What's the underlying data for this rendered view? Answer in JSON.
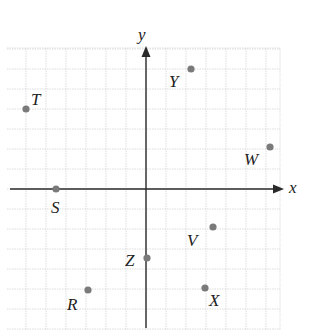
{
  "diagram": {
    "type": "coordinate-plane",
    "axes": {
      "x_label": "x",
      "y_label": "y"
    },
    "grid": {
      "x_min": -7,
      "x_max": 6.7,
      "y_min": -7,
      "y_max": 7,
      "cell_px": 20
    },
    "points": [
      {
        "name": "T",
        "x": -6,
        "y": 4,
        "label_dx": 5,
        "label_dy": -4
      },
      {
        "name": "Y",
        "x": 2.25,
        "y": 6,
        "label_dx": -22,
        "label_dy": 18
      },
      {
        "name": "W",
        "x": 6.2,
        "y": 2.1,
        "label_dx": -26,
        "label_dy": 18
      },
      {
        "name": "S",
        "x": -4.5,
        "y": 0,
        "label_dx": -5,
        "label_dy": 24
      },
      {
        "name": "V",
        "x": 3.35,
        "y": -1.9,
        "label_dx": -26,
        "label_dy": 19
      },
      {
        "name": "Z",
        "x": 0.05,
        "y": -3.45,
        "label_dx": -22,
        "label_dy": 8
      },
      {
        "name": "R",
        "x": -2.9,
        "y": -5.05,
        "label_dx": -21,
        "label_dy": 20
      },
      {
        "name": "X",
        "x": 2.95,
        "y": -4.95,
        "label_dx": 4,
        "label_dy": 18
      }
    ]
  }
}
